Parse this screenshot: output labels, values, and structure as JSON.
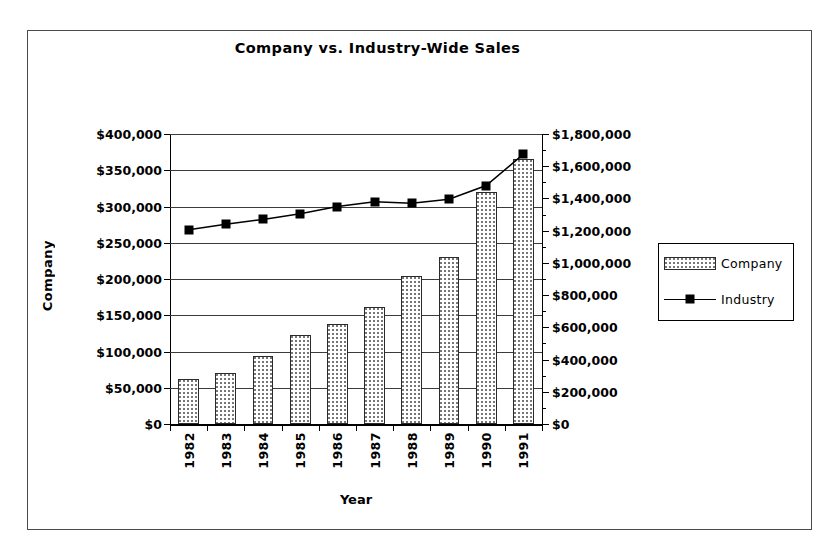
{
  "frame": {
    "border_color": "#4a4a4a"
  },
  "chart_data": {
    "type": "bar",
    "title": "Company vs. Industry-Wide Sales",
    "xlabel": "Year",
    "ylabel": "Company",
    "ylabel_secondary": "",
    "categories": [
      "1982",
      "1983",
      "1984",
      "1985",
      "1986",
      "1987",
      "1988",
      "1989",
      "1990",
      "1991"
    ],
    "grid": true,
    "legend_position": "right",
    "ylim": [
      0,
      400000
    ],
    "ylim_secondary": [
      0,
      1800000
    ],
    "yticks": [
      0,
      50000,
      100000,
      150000,
      200000,
      250000,
      300000,
      350000,
      400000
    ],
    "ytick_labels": [
      "$0",
      "$50,000",
      "$100,000",
      "$150,000",
      "$200,000",
      "$250,000",
      "$300,000",
      "$350,000",
      "$400,000"
    ],
    "ytick_labels_secondary": [
      "$0",
      "$200,000",
      "$400,000",
      "$600,000",
      "$800,000",
      "$1,000,000",
      "$1,200,000",
      "$1,400,000",
      "$1,600,000",
      "$1,800,000"
    ],
    "yticks_secondary": [
      0,
      200000,
      400000,
      600000,
      800000,
      1000000,
      1200000,
      1400000,
      1600000,
      1800000
    ],
    "series": [
      {
        "name": "Company",
        "type": "bar",
        "axis": "left",
        "values": [
          62000,
          70000,
          94000,
          123000,
          138000,
          162000,
          204000,
          231000,
          320000,
          365000
        ]
      },
      {
        "name": "Industry",
        "type": "line",
        "axis": "right",
        "marker": "square",
        "values": [
          1205000,
          1240000,
          1270000,
          1305000,
          1350000,
          1380000,
          1370000,
          1395000,
          1480000,
          1675000
        ]
      }
    ]
  },
  "legend": {
    "entries": [
      {
        "label": "Company",
        "swatch": "bar-swatch"
      },
      {
        "label": "Industry",
        "swatch": "line-marker-swatch"
      }
    ]
  }
}
